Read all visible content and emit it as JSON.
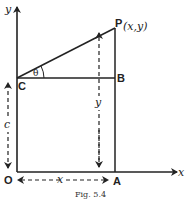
{
  "diagram": {
    "axes": {
      "x_label": "x",
      "y_label": "y"
    },
    "points": {
      "origin": "O",
      "C": "C",
      "B": "B",
      "P": "P",
      "P_coords": "(x,y)",
      "A": "A"
    },
    "angle_label": "θ",
    "dimensions": {
      "c": "c",
      "y": "y",
      "x": "x"
    },
    "caption": "Fig. 5.4"
  }
}
